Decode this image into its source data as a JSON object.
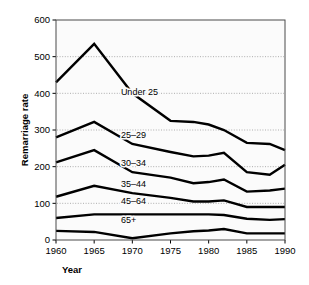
{
  "chart_data": {
    "type": "line",
    "title": "",
    "xlabel": "Year",
    "ylabel": "Remarriage rate",
    "x": [
      1960,
      1965,
      1970,
      1975,
      1978,
      1980,
      1982,
      1985,
      1988,
      1990
    ],
    "xlim": [
      1960,
      1990
    ],
    "ylim": [
      0,
      600
    ],
    "xticks": [
      "1960",
      "1965",
      "1970",
      "1975",
      "1980",
      "1985",
      "1990"
    ],
    "xtick_values": [
      1960,
      1965,
      1970,
      1975,
      1980,
      1985,
      1990
    ],
    "yticks": [
      "0",
      "100",
      "200",
      "300",
      "400",
      "500",
      "600"
    ],
    "ytick_values": [
      0,
      100,
      200,
      300,
      400,
      500,
      600
    ],
    "grid": "horizontal-dotted",
    "legend": "inline-labels",
    "series": [
      {
        "name": "Under 25",
        "label": "Under 25",
        "label_x": 1968.5,
        "label_y": 395,
        "values": [
          430,
          535,
          400,
          325,
          322,
          315,
          300,
          265,
          262,
          245
        ]
      },
      {
        "name": "25-29",
        "label": "25–29",
        "label_x": 1968.5,
        "label_y": 278,
        "values": [
          280,
          322,
          262,
          240,
          228,
          230,
          238,
          185,
          178,
          205
        ]
      },
      {
        "name": "30-34",
        "label": "30–34",
        "label_x": 1968.5,
        "label_y": 202,
        "values": [
          212,
          245,
          185,
          170,
          155,
          158,
          165,
          132,
          135,
          140
        ]
      },
      {
        "name": "35-44",
        "label": "35–44",
        "label_x": 1968.5,
        "label_y": 145,
        "values": [
          118,
          148,
          128,
          115,
          105,
          105,
          108,
          90,
          90,
          90
        ]
      },
      {
        "name": "45-64",
        "label": "45–64",
        "label_x": 1968.5,
        "label_y": 97,
        "values": [
          60,
          70,
          70,
          70,
          70,
          70,
          68,
          58,
          55,
          57
        ]
      },
      {
        "name": "65+",
        "label": "65+",
        "label_x": 1968.5,
        "label_y": 46,
        "values": [
          25,
          22,
          5,
          18,
          24,
          26,
          30,
          18,
          18,
          18
        ]
      }
    ]
  }
}
